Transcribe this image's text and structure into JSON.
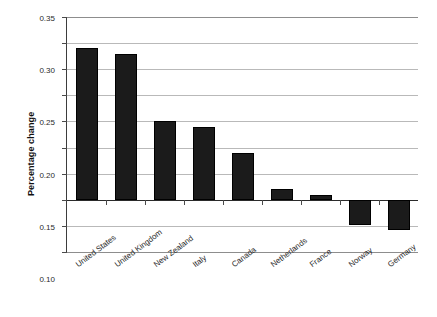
{
  "chart_data": {
    "type": "bar",
    "title": "",
    "subtitle": "",
    "xlabel": "",
    "ylabel": "Percentage change",
    "categories": [
      "United States",
      "United Kingdom",
      "New Zealand",
      "Italy",
      "Canada",
      "Netherlands",
      "France",
      "Norway",
      "Germany"
    ],
    "values": [
      0.29,
      0.28,
      0.15,
      0.14,
      0.09,
      0.02,
      0.01,
      -0.048,
      -0.058
    ],
    "ylim": [
      -0.1,
      0.35
    ],
    "ytick_values": [
      0.35,
      0.3,
      0.25,
      0.2,
      0.15,
      0.1,
      0.05,
      0.0,
      -0.05,
      -0.1
    ],
    "ytick_labels": [
      "0.35",
      "0.30",
      "0.25",
      "0.20",
      "0.15",
      "0.10",
      "0.05",
      "0.0",
      "-0.05",
      "-0.1"
    ],
    "grid": true,
    "legend": false,
    "legend_position": "none",
    "bar_color": "#1b1b1b",
    "gridline_color": "#b9b9b9",
    "axis_color": "#3d3d3d",
    "background_color": "#ffffff",
    "zero_baseline": 0.0,
    "annotations": []
  },
  "axis": {
    "y_title": "Percentage change"
  }
}
